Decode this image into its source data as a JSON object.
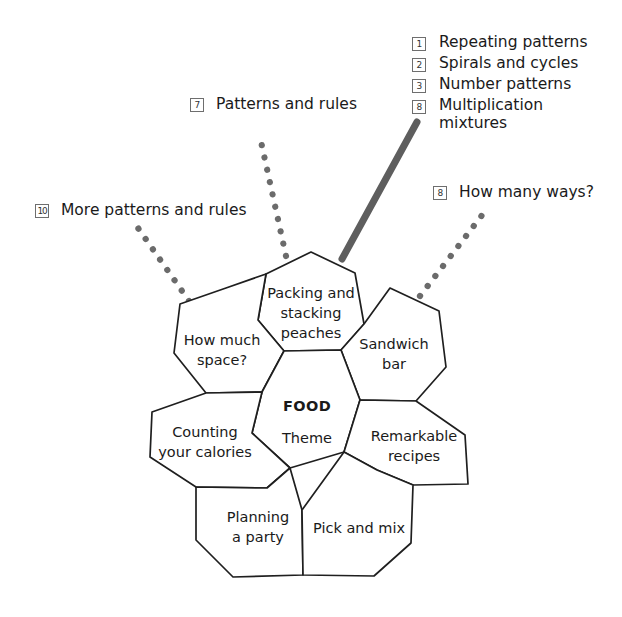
{
  "diagram": {
    "title_cell": {
      "heading": "FOOD",
      "subheading": "Theme"
    },
    "cells": [
      {
        "id": "packing",
        "lines": [
          "Packing and",
          "stacking",
          "peaches"
        ]
      },
      {
        "id": "how-much-space",
        "lines": [
          "How much",
          "space?"
        ]
      },
      {
        "id": "sandwich-bar",
        "lines": [
          "Sandwich",
          "bar"
        ]
      },
      {
        "id": "counting-calories",
        "lines": [
          "Counting",
          "your calories"
        ]
      },
      {
        "id": "remarkable-recipes",
        "lines": [
          "Remarkable",
          "recipes"
        ]
      },
      {
        "id": "planning-a-party",
        "lines": [
          "Planning",
          "a party"
        ]
      },
      {
        "id": "pick-and-mix",
        "lines": [
          "Pick and mix"
        ]
      }
    ],
    "annotations": [
      {
        "id": "patterns-and-rules",
        "badge": "7",
        "text": "Patterns and rules",
        "connector": "dotted"
      },
      {
        "id": "more-patterns-and-rules",
        "badge": "10",
        "text": "More patterns and rules",
        "connector": "dotted"
      },
      {
        "id": "how-many-ways",
        "badge": "8",
        "text": "How many ways?",
        "connector": "dotted"
      }
    ],
    "annotation_group": {
      "id": "multiplication-group",
      "connector": "solid",
      "rows": [
        {
          "badge": "1",
          "text": "Repeating patterns"
        },
        {
          "badge": "2",
          "text": "Spirals and cycles"
        },
        {
          "badge": "3",
          "text": "Number patterns"
        },
        {
          "badge": "8",
          "text": "Multiplication\nmixtures"
        }
      ]
    },
    "colors": {
      "cell_stroke": "#1f1f1f",
      "cell_fill": "#ffffff",
      "connector_solid": "#5e5e5e",
      "connector_dotted": "#6b6b6b",
      "text": "#1a1a1a",
      "badge_border": "#6e6e6e",
      "background": "#ffffff"
    }
  }
}
